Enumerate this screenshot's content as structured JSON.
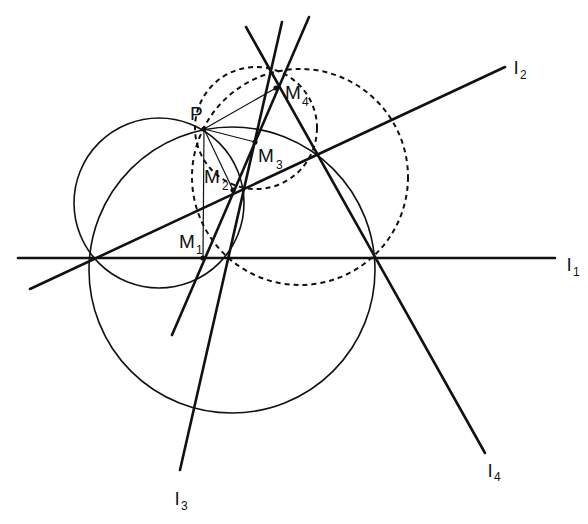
{
  "diagram": {
    "type": "geometry-construction",
    "colors": {
      "stroke": "#111111",
      "background": "#ffffff"
    },
    "points": {
      "P": {
        "label": "P",
        "x": 204,
        "y": 129
      },
      "M1": {
        "label": "M",
        "sub": "1",
        "x": 203,
        "y": 258
      },
      "M2": {
        "label": "M",
        "sub": "2",
        "x": 233,
        "y": 190
      },
      "M3": {
        "label": "M",
        "sub": "3",
        "x": 255,
        "y": 142
      },
      "M4": {
        "label": "M",
        "sub": "4",
        "x": 276,
        "y": 88
      }
    },
    "lines": [
      {
        "id": "l1",
        "label": "l",
        "sub": "1",
        "x1": 18,
        "y1": 258,
        "x2": 555,
        "y2": 258
      },
      {
        "id": "l2",
        "label": "l",
        "sub": "2",
        "x1": 30,
        "y1": 289,
        "x2": 505,
        "y2": 67
      },
      {
        "id": "l3",
        "label": "l",
        "sub": "3",
        "x1": 282,
        "y1": 22,
        "x2": 180,
        "y2": 470
      },
      {
        "id": "l4",
        "label": "l",
        "sub": "4",
        "x1": 246,
        "y1": 27,
        "x2": 485,
        "y2": 453
      },
      {
        "id": "simson",
        "label": "",
        "sub": "",
        "x1": 309,
        "y1": 17,
        "x2": 172,
        "y2": 335
      }
    ],
    "circles": [
      {
        "id": "c-small-left",
        "cx": 159,
        "cy": 203,
        "r": 85,
        "dashed": false
      },
      {
        "id": "c-large",
        "cx": 232,
        "cy": 270,
        "r": 143,
        "dashed": false
      },
      {
        "id": "c-dashed-large",
        "cx": 300,
        "cy": 177,
        "r": 108,
        "dashed": true
      },
      {
        "id": "c-dashed-small",
        "cx": 256,
        "cy": 128,
        "r": 61,
        "dashed": true
      }
    ],
    "labels": {
      "P": "P",
      "M": "M",
      "l": "l",
      "s1": "1",
      "s2": "2",
      "s3": "3",
      "s4": "4"
    }
  }
}
